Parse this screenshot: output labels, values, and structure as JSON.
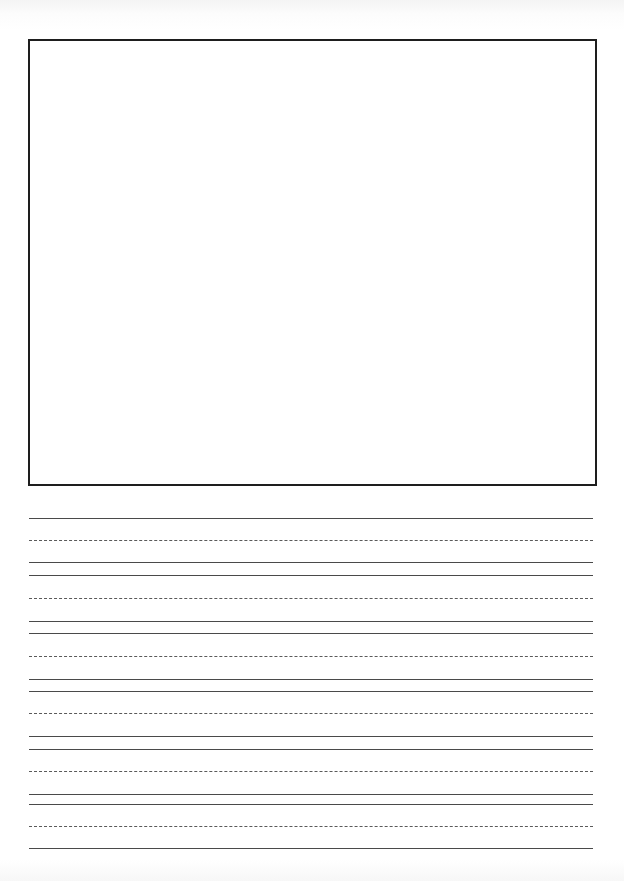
{
  "page": {
    "type": "handwriting practice paper",
    "background_color": "#ffffff",
    "line_color": "#4a4a4a"
  },
  "drawing_box": {
    "left": 28,
    "top": 39,
    "right": 597,
    "bottom": 486,
    "border_color": "#1e1e1e"
  },
  "writing_rows": [
    {
      "top": 518,
      "mid": 540,
      "base": 562
    },
    {
      "top": 575,
      "mid": 598,
      "base": 621
    },
    {
      "top": 633,
      "mid": 656,
      "base": 679
    },
    {
      "top": 691,
      "mid": 713,
      "base": 736
    },
    {
      "top": 749,
      "mid": 771,
      "base": 794
    },
    {
      "top": 804,
      "mid": 826,
      "base": 848
    }
  ]
}
